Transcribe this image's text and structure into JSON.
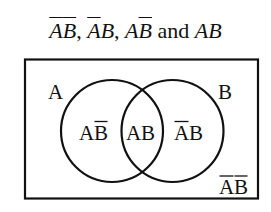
{
  "title": {
    "terms": [
      {
        "a": "A",
        "a_bar": true,
        "b": "B",
        "b_bar": true,
        "sep": ", "
      },
      {
        "a": "A",
        "a_bar": true,
        "b": "B",
        "b_bar": false,
        "sep": ", "
      },
      {
        "a": "A",
        "a_bar": false,
        "b": "B",
        "b_bar": true,
        "sep": " "
      },
      {
        "a": "A",
        "a_bar": false,
        "b": "B",
        "b_bar": false,
        "sep": ""
      }
    ],
    "conjunction": "and",
    "text": "ĀB̄, ĀB, AB̄ and AB"
  },
  "venn": {
    "set_a_label": "A",
    "set_b_label": "B",
    "regions": {
      "a_only": {
        "left": "A",
        "right": "B",
        "right_bar": true,
        "left_bar": false
      },
      "both": {
        "left": "A",
        "right": "B",
        "left_bar": false,
        "right_bar": false
      },
      "b_only": {
        "left": "A",
        "right": "B",
        "left_bar": true,
        "right_bar": false
      },
      "neither": {
        "left": "A",
        "right": "B",
        "left_bar": true,
        "right_bar": true
      }
    },
    "stroke_color": "#111111",
    "background": "#ffffff"
  },
  "labels": {
    "t1a": "A",
    "t1b": "B",
    "sep1": ", ",
    "t2a": "A",
    "t2b": "B",
    "sep2": ", ",
    "t3a": "A",
    "t3b": "B",
    "sep3": " ",
    "and": "and",
    "t4a": "A",
    "t4b": "B",
    "set_a": "A",
    "set_b": "B",
    "r_aonly_a": "A",
    "r_aonly_b": "B",
    "r_both_a": "A",
    "r_both_b": "B",
    "r_bonly_a": "A",
    "r_bonly_b": "B",
    "r_none_a": "A",
    "r_none_b": "B"
  }
}
